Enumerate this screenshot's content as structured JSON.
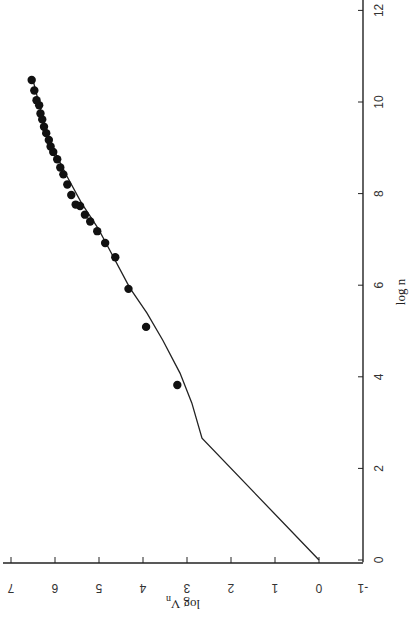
{
  "chart_data": {
    "type": "scatter",
    "title": "",
    "orientation_note": "figure printed rotated 90 degrees",
    "xlabel": "log n",
    "ylabel": "log V_n",
    "xlim": [
      0,
      12
    ],
    "ylim": [
      -1,
      7
    ],
    "x_ticks": [
      0,
      2,
      4,
      6,
      8,
      10,
      12
    ],
    "y_ticks": [
      -1,
      0,
      1,
      2,
      3,
      4,
      5,
      6,
      7
    ],
    "grid": false,
    "legend": null,
    "series": [
      {
        "name": "observed",
        "kind": "scatter",
        "marker": "filled-circle",
        "points": [
          {
            "x": 3.82,
            "y": 3.22
          },
          {
            "x": 5.09,
            "y": 3.93
          },
          {
            "x": 5.92,
            "y": 4.33
          },
          {
            "x": 6.61,
            "y": 4.63
          },
          {
            "x": 6.92,
            "y": 4.86
          },
          {
            "x": 7.18,
            "y": 5.04
          },
          {
            "x": 7.39,
            "y": 5.2
          },
          {
            "x": 7.54,
            "y": 5.32
          },
          {
            "x": 7.73,
            "y": 5.43
          },
          {
            "x": 7.76,
            "y": 5.53
          },
          {
            "x": 7.97,
            "y": 5.63
          },
          {
            "x": 8.2,
            "y": 5.72
          },
          {
            "x": 8.42,
            "y": 5.81
          },
          {
            "x": 8.57,
            "y": 5.88
          },
          {
            "x": 8.75,
            "y": 5.95
          },
          {
            "x": 8.91,
            "y": 6.04
          },
          {
            "x": 9.03,
            "y": 6.1
          },
          {
            "x": 9.17,
            "y": 6.14
          },
          {
            "x": 9.32,
            "y": 6.2
          },
          {
            "x": 9.46,
            "y": 6.25
          },
          {
            "x": 9.62,
            "y": 6.29
          },
          {
            "x": 9.75,
            "y": 6.33
          },
          {
            "x": 9.93,
            "y": 6.36
          },
          {
            "x": 10.04,
            "y": 6.42
          },
          {
            "x": 10.25,
            "y": 6.47
          },
          {
            "x": 10.48,
            "y": 6.53
          }
        ]
      },
      {
        "name": "model",
        "kind": "line",
        "points": [
          {
            "x": 0.0,
            "y": 0.0
          },
          {
            "x": 2.66,
            "y": 2.66
          },
          {
            "x": 3.43,
            "y": 2.89
          },
          {
            "x": 4.08,
            "y": 3.16
          },
          {
            "x": 4.8,
            "y": 3.55
          },
          {
            "x": 5.39,
            "y": 3.91
          },
          {
            "x": 5.94,
            "y": 4.3
          },
          {
            "x": 6.9,
            "y": 4.83
          },
          {
            "x": 7.24,
            "y": 5.02
          },
          {
            "x": 7.8,
            "y": 5.4
          },
          {
            "x": 8.4,
            "y": 5.74
          },
          {
            "x": 9.0,
            "y": 6.05
          },
          {
            "x": 9.6,
            "y": 6.27
          },
          {
            "x": 10.1,
            "y": 6.4
          },
          {
            "x": 10.48,
            "y": 6.5
          }
        ]
      }
    ]
  },
  "labels": {
    "x_axis_title": "log n",
    "y_axis_title_main": "log V",
    "y_axis_title_sub": "n"
  }
}
